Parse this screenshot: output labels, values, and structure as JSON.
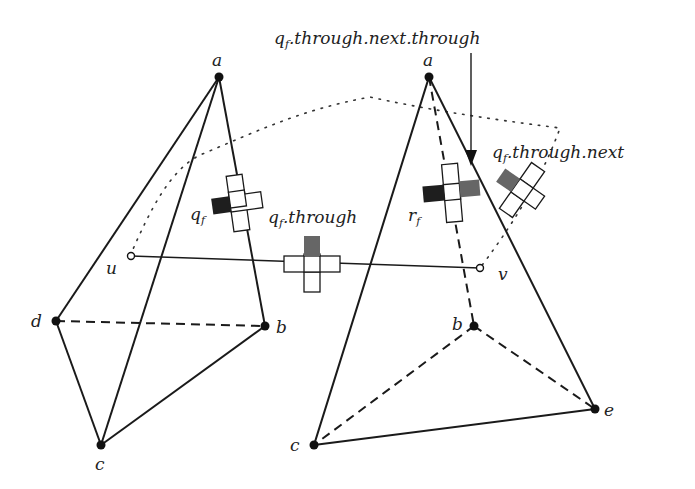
{
  "diagram": {
    "labels": {
      "a_left": "a",
      "b_left": "b",
      "c_left": "c",
      "d_left": "d",
      "a_right": "a",
      "b_right": "b",
      "c_right": "c",
      "e_right": "e",
      "u": "u",
      "v": "v",
      "qf_base": "q",
      "qf_sub": "f",
      "rf_base": "r",
      "rf_sub": "f",
      "through_base": "q",
      "through_sub": "f",
      "through_rest": ".through",
      "next_base": "q",
      "next_sub": "f",
      "next_rest": ".through.next",
      "nt_base": "q",
      "nt_sub": "f",
      "nt_rest": ".through.next.through"
    },
    "fills": {
      "dark": "#1e1e1e",
      "grey": "#666666"
    }
  }
}
